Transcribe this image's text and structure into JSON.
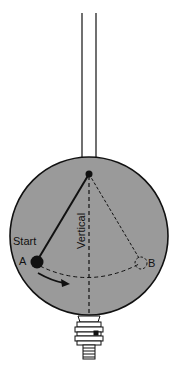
{
  "diagram": {
    "labels": {
      "start": "Start",
      "point_a": "A",
      "point_b": "B",
      "vertical": "Vertical"
    },
    "colors": {
      "background": "#ffffff",
      "sphere_fill": "#9a9a9a",
      "stroke": "#111111"
    },
    "elements": [
      "suspension-rods",
      "sphere",
      "pivot",
      "pendulum-arm-start",
      "pendulum-arm-end-dashed",
      "vertical-dashed-line",
      "swing-arc-dashed",
      "bob-a",
      "bob-b-ghost",
      "direction-arrow",
      "valve-fitting"
    ]
  }
}
